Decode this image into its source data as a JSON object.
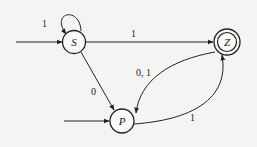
{
  "diagram": {
    "type": "finite-automaton",
    "states": [
      {
        "id": "S",
        "label": "S",
        "initial": true,
        "accepting": false
      },
      {
        "id": "Z",
        "label": "Z",
        "initial": false,
        "accepting": true
      },
      {
        "id": "P",
        "label": "P",
        "initial": true,
        "accepting": false
      }
    ],
    "transitions": [
      {
        "from": "S",
        "to": "S",
        "label": "1"
      },
      {
        "from": "S",
        "to": "Z",
        "label": "1"
      },
      {
        "from": "S",
        "to": "P",
        "label": "0"
      },
      {
        "from": "Z",
        "to": "P",
        "label": "0, 1"
      },
      {
        "from": "P",
        "to": "Z",
        "label": "1"
      }
    ],
    "colors": {
      "stroke": "#222222",
      "background": "#f4f4f2"
    }
  }
}
